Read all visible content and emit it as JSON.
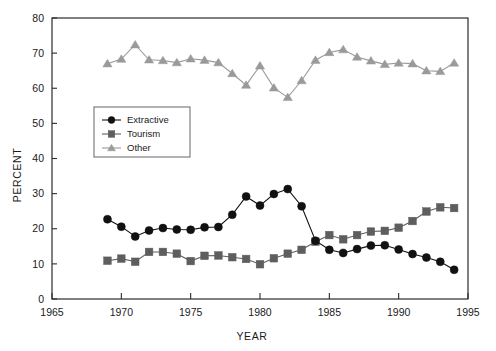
{
  "chart_data": {
    "type": "line",
    "title": "",
    "xlabel": "YEAR",
    "ylabel": "PERCENT",
    "xlim": [
      1965,
      1995
    ],
    "ylim": [
      0,
      80
    ],
    "xticks": [
      1965,
      1970,
      1975,
      1980,
      1985,
      1990,
      1995
    ],
    "yticks": [
      0,
      10,
      20,
      30,
      40,
      50,
      60,
      70,
      80
    ],
    "grid": false,
    "legend_position": "upper-left-inset",
    "x": [
      1969,
      1970,
      1971,
      1972,
      1973,
      1974,
      1975,
      1976,
      1977,
      1978,
      1979,
      1980,
      1981,
      1982,
      1983,
      1984,
      1985,
      1986,
      1987,
      1988,
      1989,
      1990,
      1991,
      1992,
      1993,
      1994
    ],
    "series": [
      {
        "name": "Extractive",
        "color": "#111111",
        "marker": "circle",
        "values": [
          22.7,
          20.6,
          17.8,
          19.5,
          20.2,
          19.8,
          19.7,
          20.4,
          20.5,
          24.0,
          29.2,
          26.6,
          29.9,
          31.3,
          26.4,
          16.6,
          14.0,
          13.1,
          14.2,
          15.2,
          15.3,
          14.1,
          12.8,
          11.8,
          10.6,
          8.3
        ]
      },
      {
        "name": "Tourism",
        "color": "#5e5e5e",
        "marker": "square",
        "values": [
          10.9,
          11.5,
          10.6,
          13.4,
          13.4,
          12.9,
          10.8,
          12.3,
          12.4,
          11.9,
          11.4,
          9.9,
          11.6,
          12.9,
          14.0,
          16.3,
          18.2,
          17.0,
          18.2,
          19.2,
          19.4,
          20.3,
          22.2,
          24.9,
          26.1,
          25.9
        ]
      },
      {
        "name": "Other",
        "color": "#9a9a9a",
        "marker": "triangle",
        "values": [
          67.0,
          68.3,
          72.4,
          68.1,
          67.9,
          67.3,
          68.4,
          68.0,
          67.3,
          64.2,
          60.9,
          66.4,
          60.1,
          57.4,
          62.2,
          68.0,
          70.2,
          71.0,
          68.9,
          67.8,
          66.8,
          67.2,
          67.0,
          65.0,
          64.8,
          67.2
        ]
      }
    ]
  },
  "legend": {
    "entries": [
      {
        "label": "Extractive"
      },
      {
        "label": "Tourism"
      },
      {
        "label": "Other"
      }
    ]
  },
  "axes": {
    "x_title": "YEAR",
    "y_title": "PERCENT"
  },
  "colors": {
    "extractive": "#111111",
    "tourism": "#5e5e5e",
    "other": "#9a9a9a",
    "axis": "#2b2b2b",
    "background": "#ffffff"
  }
}
